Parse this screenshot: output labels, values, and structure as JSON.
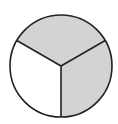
{
  "diagram": {
    "type": "fraction-circle",
    "total_parts": 3,
    "shaded_parts": 2,
    "fraction_shaded": "2/3",
    "colors": {
      "shaded": "#d3d3d3",
      "unshaded": "#ffffff",
      "stroke": "#222222"
    },
    "sectors": [
      {
        "name": "top",
        "shaded": true
      },
      {
        "name": "lower-right",
        "shaded": true
      },
      {
        "name": "lower-left",
        "shaded": false
      }
    ]
  }
}
